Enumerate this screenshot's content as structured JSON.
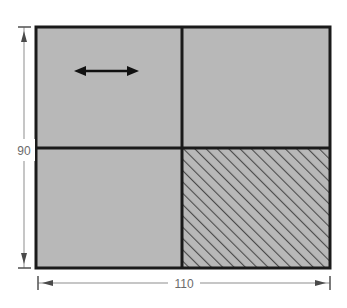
{
  "figure": {
    "type": "engineering-dimension-diagram",
    "background_color": "#ffffff",
    "fill_color": "#b8b8b8",
    "line_color": "#1a1a1a",
    "hatch_color": "#4a4a4a",
    "dimension_color": "#6b6b6b",
    "outline": {
      "x": 36,
      "y": 27,
      "width": 294,
      "height": 241,
      "stroke_width": 3
    },
    "dividers": {
      "vertical_x": 182,
      "horizontal_y": 148,
      "stroke_width": 3
    },
    "quadrants": [
      {
        "name": "top-left",
        "fill": "#b8b8b8",
        "hatched": false,
        "x": 36,
        "y": 27,
        "width": 146,
        "height": 121
      },
      {
        "name": "top-right",
        "fill": "#b8b8b8",
        "hatched": false,
        "x": 182,
        "y": 27,
        "width": 148,
        "height": 121
      },
      {
        "name": "bottom-left",
        "fill": "#b8b8b8",
        "hatched": false,
        "x": 36,
        "y": 148,
        "width": 146,
        "height": 120
      },
      {
        "name": "bottom-right",
        "fill": "#b8b8b8",
        "hatched": true,
        "hatch_angle_deg": 45,
        "hatch_spacing": 8,
        "x": 182,
        "y": 148,
        "width": 148,
        "height": 120
      }
    ],
    "arrow": {
      "name": "horizontal-double-arrow",
      "x1": 76,
      "x2": 137,
      "y": 71,
      "stroke_width": 2,
      "heads": "both"
    },
    "dimensions": [
      {
        "id": "height",
        "label": "90",
        "orientation": "vertical",
        "line_x": 24,
        "y1": 27,
        "y2": 268,
        "label_x": 16,
        "label_y": 151,
        "extension_from": 36
      },
      {
        "id": "width",
        "label": "110",
        "orientation": "horizontal",
        "line_y": 283,
        "x1": 38,
        "x2": 330,
        "label_x": 183,
        "label_y": 287
      }
    ]
  }
}
